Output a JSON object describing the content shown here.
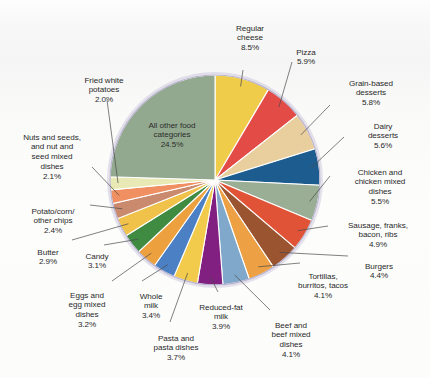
{
  "figure": {
    "background": "#fbfbfa",
    "pie_outline": "#b9b4cf",
    "pie_rim": "#cfcadf",
    "slice_divider": "#ffffff"
  },
  "chart_data": {
    "type": "pie",
    "title": "",
    "subtitle": "",
    "xlabel": "",
    "ylabel": "",
    "grid": false,
    "legend_position": "callout-labels",
    "start_angle_deg": -90,
    "direction": "clockwise",
    "total_percent": 100.0,
    "labels": [
      "Regular cheese",
      "Pizza",
      "Grain-based desserts",
      "Dairy desserts",
      "Chicken and chicken mixed dishes",
      "Sausage, franks, bacon, ribs",
      "Burgers",
      "Tortillas, burritos, tacos",
      "Beef and beef mixed dishes",
      "Reduced-fat milk",
      "Pasta and pasta dishes",
      "Whole milk",
      "Eggs and egg mixed dishes",
      "Candy",
      "Butter",
      "Potato/corn/other chips",
      "Nuts and seeds, and nut and seed mixed dishes",
      "Fried white potatoes",
      "All other food categories"
    ],
    "values": [
      8.5,
      5.9,
      5.8,
      5.6,
      5.5,
      4.9,
      4.4,
      4.1,
      4.1,
      3.9,
      3.7,
      3.4,
      3.2,
      3.1,
      2.9,
      2.4,
      2.1,
      2.0,
      24.5
    ],
    "colors": [
      "#f0cc4b",
      "#e34b46",
      "#e8cf9d",
      "#1d5c8e",
      "#9aae96",
      "#e05336",
      "#9a5430",
      "#eda044",
      "#7fa8cb",
      "#822082",
      "#f2cb4d",
      "#4b81c4",
      "#eda03e",
      "#3f8b42",
      "#f0c24a",
      "#c98a6e",
      "#ef8f62",
      "#e8e9b4",
      "#93a98f"
    ]
  },
  "callouts": [
    {
      "name": "regular-cheese",
      "label": "Regular\ncheese",
      "pct": "8.5%"
    },
    {
      "name": "pizza",
      "label": "Pizza",
      "pct": "5.9%"
    },
    {
      "name": "grain-based-desserts",
      "label": "Grain-based\ndesserts",
      "pct": "5.8%"
    },
    {
      "name": "dairy-desserts",
      "label": "Dairy\ndesserts",
      "pct": "5.6%"
    },
    {
      "name": "chicken-dishes",
      "label": "Chicken and\nchicken mixed\ndishes",
      "pct": "5.5%"
    },
    {
      "name": "sausage-franks",
      "label": "Sausage, franks,\nbacon, ribs",
      "pct": "4.9%"
    },
    {
      "name": "burgers",
      "label": "Burgers",
      "pct": "4.4%"
    },
    {
      "name": "tortillas",
      "label": "Tortillas,\nburritos, tacos",
      "pct": "4.1%"
    },
    {
      "name": "beef-dishes",
      "label": "Beef and\nbeef mixed\ndishes",
      "pct": "4.1%"
    },
    {
      "name": "reduced-fat-milk",
      "label": "Reduced-fat\nmilk",
      "pct": "3.9%"
    },
    {
      "name": "pasta-dishes",
      "label": "Pasta and\npasta dishes",
      "pct": "3.7%"
    },
    {
      "name": "whole-milk",
      "label": "Whole\nmilk",
      "pct": "3.4%"
    },
    {
      "name": "eggs-dishes",
      "label": "Eggs and\negg mixed\ndishes",
      "pct": "3.2%"
    },
    {
      "name": "candy",
      "label": "Candy",
      "pct": "3.1%"
    },
    {
      "name": "butter",
      "label": "Butter",
      "pct": "2.9%"
    },
    {
      "name": "potato-corn-chips",
      "label": "Potato/corn/\nother chips",
      "pct": "2.4%"
    },
    {
      "name": "nuts-and-seeds",
      "label": "Nuts and seeds,\nand nut and\nseed mixed\ndishes",
      "pct": "2.1%"
    },
    {
      "name": "fried-white-potatoes",
      "label": "Fried white\npotatoes",
      "pct": "2.0%"
    },
    {
      "name": "all-other-food",
      "label": "All other food\ncategories",
      "pct": "24.5%"
    }
  ]
}
